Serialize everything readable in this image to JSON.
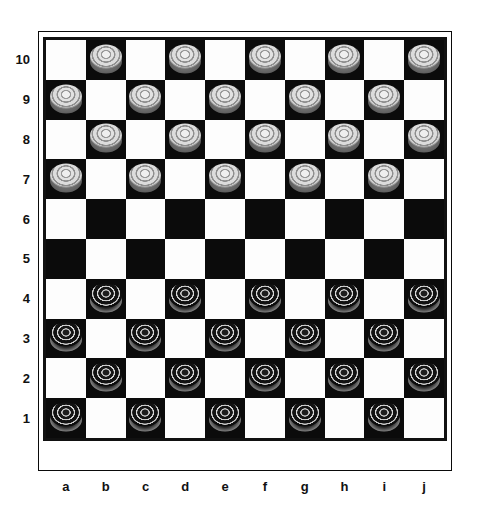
{
  "board": {
    "title": "International draughts board",
    "size": 10,
    "files": [
      "a",
      "b",
      "c",
      "d",
      "e",
      "f",
      "g",
      "h",
      "i",
      "j"
    ],
    "ranks": [
      "10",
      "9",
      "8",
      "7",
      "6",
      "5",
      "4",
      "3",
      "2",
      "1"
    ],
    "colors": {
      "light_square": "#fdfdfd",
      "dark_square": "#0b0b0b",
      "frame": "#0a0a0a",
      "label_text": "#111111",
      "white_piece": "#dcdcdc",
      "black_piece": "#111111"
    },
    "piece_counts": {
      "white": 20,
      "black": 20
    },
    "pieces": [
      {
        "square": "b10",
        "color": "white"
      },
      {
        "square": "d10",
        "color": "white"
      },
      {
        "square": "f10",
        "color": "white"
      },
      {
        "square": "h10",
        "color": "white"
      },
      {
        "square": "j10",
        "color": "white"
      },
      {
        "square": "a9",
        "color": "white"
      },
      {
        "square": "c9",
        "color": "white"
      },
      {
        "square": "e9",
        "color": "white"
      },
      {
        "square": "g9",
        "color": "white"
      },
      {
        "square": "i9",
        "color": "white"
      },
      {
        "square": "b8",
        "color": "white"
      },
      {
        "square": "d8",
        "color": "white"
      },
      {
        "square": "f8",
        "color": "white"
      },
      {
        "square": "h8",
        "color": "white"
      },
      {
        "square": "j8",
        "color": "white"
      },
      {
        "square": "a7",
        "color": "white"
      },
      {
        "square": "c7",
        "color": "white"
      },
      {
        "square": "e7",
        "color": "white"
      },
      {
        "square": "g7",
        "color": "white"
      },
      {
        "square": "i7",
        "color": "white"
      },
      {
        "square": "b4",
        "color": "black"
      },
      {
        "square": "d4",
        "color": "black"
      },
      {
        "square": "f4",
        "color": "black"
      },
      {
        "square": "h4",
        "color": "black"
      },
      {
        "square": "j4",
        "color": "black"
      },
      {
        "square": "a3",
        "color": "black"
      },
      {
        "square": "c3",
        "color": "black"
      },
      {
        "square": "e3",
        "color": "black"
      },
      {
        "square": "g3",
        "color": "black"
      },
      {
        "square": "i3",
        "color": "black"
      },
      {
        "square": "b2",
        "color": "black"
      },
      {
        "square": "d2",
        "color": "black"
      },
      {
        "square": "f2",
        "color": "black"
      },
      {
        "square": "h2",
        "color": "black"
      },
      {
        "square": "j2",
        "color": "black"
      },
      {
        "square": "a1",
        "color": "black"
      },
      {
        "square": "c1",
        "color": "black"
      },
      {
        "square": "e1",
        "color": "black"
      },
      {
        "square": "g1",
        "color": "black"
      },
      {
        "square": "i1",
        "color": "black"
      }
    ],
    "empty_ranks": [
      "6",
      "5"
    ]
  }
}
